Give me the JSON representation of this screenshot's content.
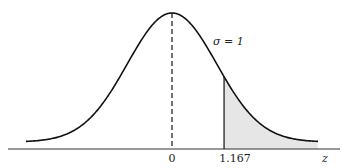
{
  "chart_data": {
    "type": "area",
    "title": "",
    "distribution": "standard normal",
    "mean": 0,
    "sigma": 1,
    "annotation": "σ = 1",
    "xlabel": "z",
    "ylabel": "",
    "tick_labels": [
      "0",
      "1.167"
    ],
    "tick_values": [
      0,
      1.167
    ],
    "shaded_region": {
      "from": 1.167,
      "to": "right tail",
      "color": "#e6e6e6"
    },
    "mean_line": {
      "x": 0,
      "style": "dashed"
    },
    "xlim": [
      -3.3,
      3.3
    ],
    "grid": false,
    "legend": "none"
  },
  "labels": {
    "zero": "0",
    "cut": "1.167",
    "axis": "z",
    "sigma": "σ = 1"
  },
  "colors": {
    "curve": "#111111",
    "shade": "#e6e6e6",
    "axis": "#333333"
  }
}
